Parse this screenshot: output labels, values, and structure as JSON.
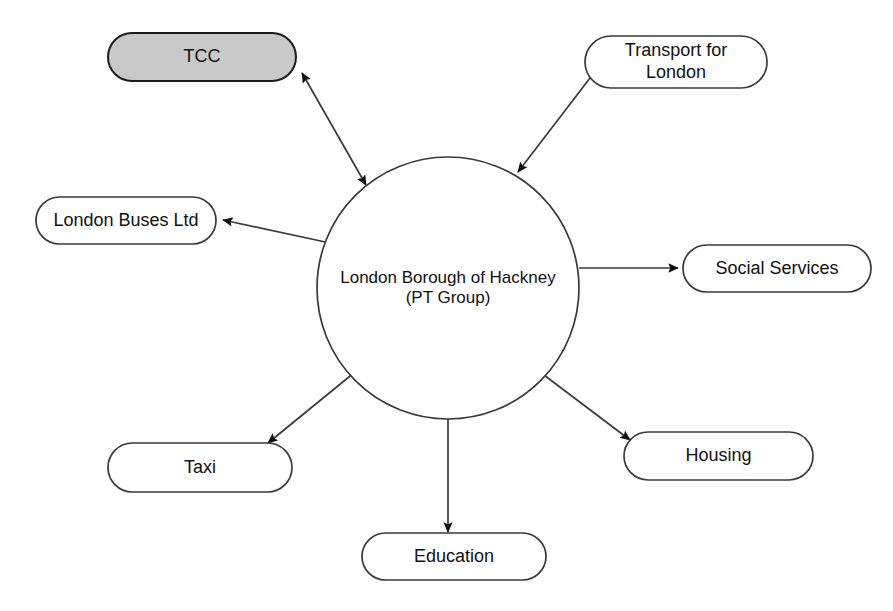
{
  "diagram": {
    "type": "hub-and-spoke relationship diagram",
    "background_color": "#ffffff",
    "line_color": "#3a3a3a",
    "text_color": "#111111",
    "center": {
      "id": "hub",
      "shape": "circle",
      "label": "London Borough of Hackney\n(PT Group)",
      "line1": "London Borough of Hackney",
      "line2": "(PT Group)",
      "fill": "#ffffff",
      "cx": 448,
      "cy": 288,
      "r": 131
    },
    "nodes": [
      {
        "id": "tcc",
        "label": "TCC",
        "shape": "rounded-pill",
        "fill": "#c9c9c9",
        "x": 108,
        "y": 33,
        "w": 188,
        "h": 48
      },
      {
        "id": "transport-for-london",
        "label": "Transport for\nLondon",
        "shape": "rounded-pill",
        "fill": "#ffffff",
        "x": 585,
        "y": 36,
        "w": 182,
        "h": 52
      },
      {
        "id": "london-buses-ltd",
        "label": "London Buses Ltd",
        "shape": "rounded-pill",
        "fill": "#ffffff",
        "x": 36,
        "y": 197,
        "w": 180,
        "h": 47
      },
      {
        "id": "social-services",
        "label": "Social Services",
        "shape": "rounded-pill",
        "fill": "#ffffff",
        "x": 683,
        "y": 245,
        "w": 188,
        "h": 47
      },
      {
        "id": "housing",
        "label": "Housing",
        "shape": "rounded-pill",
        "fill": "#ffffff",
        "x": 624,
        "y": 432,
        "w": 189,
        "h": 48
      },
      {
        "id": "taxi",
        "label": "Taxi",
        "shape": "rounded-pill",
        "fill": "#ffffff",
        "x": 108,
        "y": 443,
        "w": 184,
        "h": 49
      },
      {
        "id": "education",
        "label": "Education",
        "shape": "rounded-pill",
        "fill": "#ffffff",
        "x": 362,
        "y": 533,
        "w": 184,
        "h": 47
      }
    ],
    "edges": [
      {
        "id": "edge-hub-tcc",
        "from": "hub",
        "to": "tcc",
        "direction": "bidirectional",
        "arrow_start": true,
        "arrow_end": true
      },
      {
        "id": "edge-tfl-hub",
        "from": "transport-for-london",
        "to": "hub",
        "direction": "one-way",
        "arrow_start": false,
        "arrow_end": true
      },
      {
        "id": "edge-hub-london-buses",
        "from": "hub",
        "to": "london-buses-ltd",
        "direction": "one-way",
        "arrow_start": false,
        "arrow_end": true
      },
      {
        "id": "edge-hub-social-services",
        "from": "hub",
        "to": "social-services",
        "direction": "one-way",
        "arrow_start": false,
        "arrow_end": true
      },
      {
        "id": "edge-hub-housing",
        "from": "hub",
        "to": "housing",
        "direction": "one-way",
        "arrow_start": false,
        "arrow_end": true
      },
      {
        "id": "edge-hub-taxi",
        "from": "hub",
        "to": "taxi",
        "direction": "one-way",
        "arrow_start": false,
        "arrow_end": true
      },
      {
        "id": "edge-hub-education",
        "from": "hub",
        "to": "education",
        "direction": "one-way",
        "arrow_start": false,
        "arrow_end": true
      }
    ]
  }
}
